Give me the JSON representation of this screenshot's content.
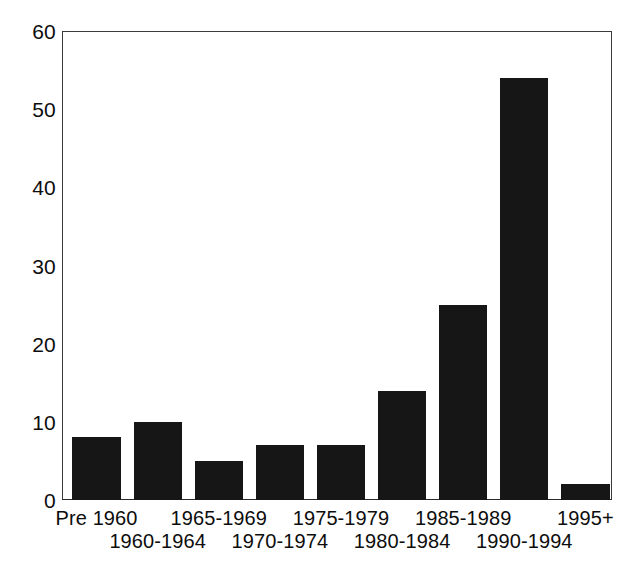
{
  "chart_data": {
    "type": "bar",
    "title": "",
    "subtitle": "",
    "xlabel": "",
    "ylabel": "",
    "categories": [
      "Pre 1960",
      "1960-1964",
      "1965-1969",
      "1970-1974",
      "1975-1979",
      "1980-1984",
      "1985-1989",
      "1990-1994",
      "1995+"
    ],
    "values": [
      8,
      10,
      5,
      7,
      7,
      14,
      25,
      54,
      2
    ],
    "ylim": [
      0,
      60
    ],
    "ytick_labels": [
      "0",
      "10",
      "20",
      "30",
      "40",
      "50",
      "60"
    ],
    "ytick_values": [
      0,
      10,
      20,
      30,
      40,
      50,
      60
    ],
    "grid": false,
    "legend": null,
    "bar_color": "#161616",
    "axis_color": "#3a3a3a",
    "background_color": "#ffffff",
    "label_rows": [
      "top",
      "bottom",
      "top",
      "bottom",
      "top",
      "bottom",
      "top",
      "bottom",
      "top"
    ],
    "annotations": []
  }
}
